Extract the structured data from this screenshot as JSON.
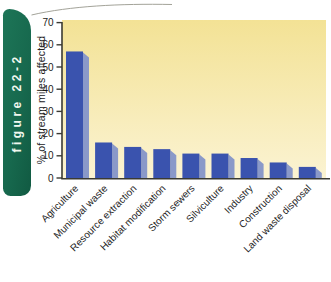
{
  "figure_tab": {
    "label": "figure 22-2"
  },
  "chart_data": {
    "type": "bar",
    "title": "",
    "xlabel": "",
    "ylabel": "% of stream miles affected",
    "categories": [
      "Agriculture",
      "Municipal waste",
      "Resource extraction",
      "Habitat modification",
      "Storm sewers",
      "Silviculture",
      "Industry",
      "Construction",
      "Land waste disposal"
    ],
    "values": [
      57,
      16,
      14,
      13,
      11,
      11,
      9,
      7,
      5
    ],
    "ylim": [
      0,
      70
    ],
    "yticks": [
      0,
      10,
      20,
      30,
      40,
      50,
      60,
      70
    ],
    "grid": false,
    "legend": "none",
    "bar_style": "3d-bevel",
    "colors": {
      "bar_front": "#3a53ae",
      "bar_side": "#8a99c9",
      "panel_top": "#f3e295",
      "panel_bottom": "#fbf3d2",
      "axis": "#3a3a33",
      "tick_text": "#1c1c19",
      "category_text": "#26261f",
      "tab_green": "#17694e",
      "tab_text": "#f2f8f0",
      "swoosh_line": "#a3a399"
    }
  }
}
